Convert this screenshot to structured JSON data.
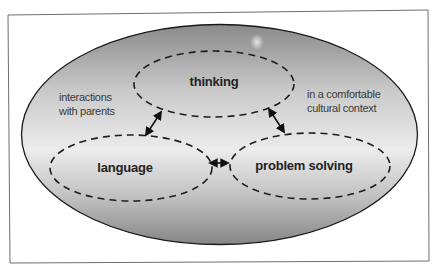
{
  "diagram": {
    "type": "nested-ellipse-concept-diagram",
    "outer_context": {
      "fill_gradient": [
        "#8a8a8a",
        "#c9c9c9",
        "#ececec",
        "#bdbdbd",
        "#858585"
      ],
      "stroke": "#1a1a1a"
    },
    "nodes": [
      {
        "id": "thinking",
        "label": "thinking"
      },
      {
        "id": "language",
        "label": "language"
      },
      {
        "id": "problem_solving",
        "label": "problem solving"
      }
    ],
    "edges": [
      {
        "from": "thinking",
        "to": "language",
        "direction": "bidirectional"
      },
      {
        "from": "thinking",
        "to": "problem_solving",
        "direction": "bidirectional"
      },
      {
        "from": "language",
        "to": "problem_solving",
        "direction": "bidirectional"
      }
    ],
    "annotations": {
      "left": {
        "line1": "interactions",
        "line2": "with parents"
      },
      "right": {
        "line1": "in a comfortable",
        "line2": "cultural context"
      }
    },
    "colors": {
      "frame": "#6e6e6e",
      "dash": "#1e1e1e",
      "arrow": "#111111",
      "node_text": "#222222",
      "annotation_text": "#3a3a3a",
      "background": "#ffffff"
    }
  }
}
